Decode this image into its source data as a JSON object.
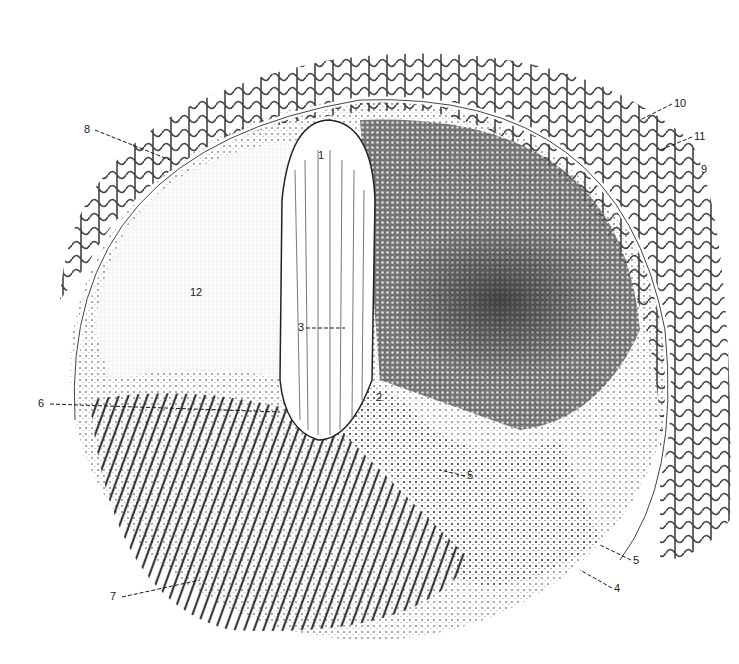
{
  "figure": {
    "type": "anatomical line illustration",
    "background": "#ffffff",
    "ink": "#1a1a1a",
    "labels": [
      {
        "id": "1",
        "text": "1",
        "x": 318,
        "y": 150
      },
      {
        "id": "2",
        "text": "2",
        "x": 376,
        "y": 398
      },
      {
        "id": "3",
        "text": "3",
        "x": 298,
        "y": 325
      },
      {
        "id": "4",
        "text": "4",
        "x": 614,
        "y": 586
      },
      {
        "id": "5a",
        "text": "5",
        "x": 467,
        "y": 473
      },
      {
        "id": "5b",
        "text": "5",
        "x": 633,
        "y": 558
      },
      {
        "id": "6",
        "text": "6",
        "x": 40,
        "y": 400
      },
      {
        "id": "7",
        "text": "7",
        "x": 111,
        "y": 593
      },
      {
        "id": "8",
        "text": "8",
        "x": 85,
        "y": 126
      },
      {
        "id": "9",
        "text": "9",
        "x": 701,
        "y": 166
      },
      {
        "id": "10",
        "text": "10",
        "x": 674,
        "y": 100
      },
      {
        "id": "11",
        "text": "11",
        "x": 694,
        "y": 133
      },
      {
        "id": "12",
        "text": "12",
        "x": 192,
        "y": 290
      }
    ]
  }
}
